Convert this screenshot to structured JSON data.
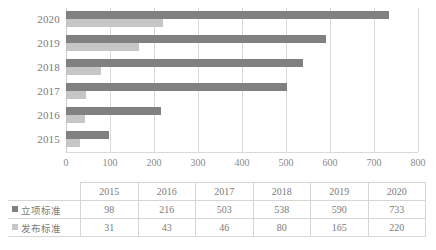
{
  "chart_data": {
    "type": "bar",
    "orientation": "horizontal",
    "title": "",
    "xlabel": "",
    "ylabel": "",
    "categories": [
      "2015",
      "2016",
      "2017",
      "2018",
      "2019",
      "2020"
    ],
    "series": [
      {
        "name": "立项标准",
        "color": "#808080",
        "values": [
          98,
          216,
          503,
          538,
          590,
          733
        ]
      },
      {
        "name": "发布标准",
        "color": "#c6c6c6",
        "values": [
          31,
          43,
          46,
          80,
          165,
          220
        ]
      }
    ],
    "xlim": [
      0,
      800
    ],
    "xticks": [
      "0",
      "100",
      "200",
      "300",
      "400",
      "500",
      "600",
      "700",
      "800"
    ],
    "grid": true,
    "legend_position": "table-row-headers",
    "category_order_top_to_bottom": [
      "2020",
      "2019",
      "2018",
      "2017",
      "2016",
      "2015"
    ]
  },
  "table": {
    "corner_label": "",
    "column_headers": [
      "2015",
      "2016",
      "2017",
      "2018",
      "2019",
      "2020"
    ],
    "rows": [
      {
        "label": "立项标准",
        "swatch": "dark-gray-square-icon",
        "values": [
          "98",
          "216",
          "503",
          "538",
          "590",
          "733"
        ]
      },
      {
        "label": "发布标准",
        "swatch": "light-gray-square-icon",
        "values": [
          "31",
          "43",
          "46",
          "80",
          "165",
          "220"
        ]
      }
    ]
  },
  "colors": {
    "series_dark": "#808080",
    "series_light": "#c6c6c6",
    "gridline": "#d9d9d9",
    "text": "#7b7b7b",
    "table_border": "#d6d6d6"
  }
}
